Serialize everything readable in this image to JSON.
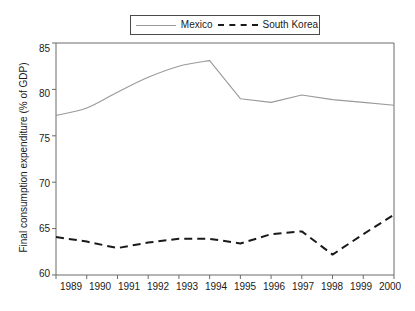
{
  "chart_data": {
    "type": "line",
    "title": "",
    "xlabel": "",
    "ylabel": "Final consumption expenditure (% of GDP)",
    "x": [
      1989,
      1990,
      1991,
      1992,
      1993,
      1994,
      1995,
      1996,
      1997,
      1998,
      1999,
      2000
    ],
    "categories": [
      "1989",
      "1990",
      "1991",
      "1992",
      "1993",
      "1994",
      "1995",
      "1996",
      "1997",
      "1998",
      "1999",
      "2000"
    ],
    "xlim": [
      1989,
      2000
    ],
    "ylim": [
      60,
      85
    ],
    "yticks": [
      60,
      65,
      70,
      75,
      80,
      85
    ],
    "ytick_labels": [
      "60",
      "65",
      "70",
      "75",
      "80",
      "85"
    ],
    "grid": false,
    "legend_position": "top-center",
    "series": [
      {
        "name": "Mexico",
        "style": "solid",
        "color": "#9a9a9a",
        "values": [
          77.2,
          78.0,
          79.7,
          81.3,
          82.5,
          83.1,
          79.0,
          78.6,
          79.4,
          78.9,
          78.6,
          78.3
        ]
      },
      {
        "name": "South Korea",
        "style": "dashed",
        "color": "#1a1a1a",
        "values": [
          64.1,
          63.6,
          62.9,
          63.5,
          63.9,
          63.9,
          63.4,
          64.4,
          64.7,
          62.2,
          64.4,
          66.5
        ]
      }
    ]
  },
  "legend": {
    "entries": [
      {
        "label": "Mexico",
        "swatch": "solid-line-gray"
      },
      {
        "label": "South Korea",
        "swatch": "dashed-line-black"
      }
    ]
  },
  "axes": {
    "y_title": "Final consumption expenditure (% of GDP)",
    "y_tick_labels": [
      "85",
      "80",
      "75",
      "70",
      "65",
      "60"
    ],
    "x_tick_labels": [
      "1989",
      "1990",
      "1991",
      "1992",
      "1993",
      "1994",
      "1995",
      "1996",
      "1997",
      "1998",
      "1999",
      "2000"
    ]
  },
  "colors": {
    "mexico_line": "#9a9a9a",
    "south_korea_line": "#1a1a1a",
    "axis": "#6b6b6b",
    "text": "#1a1a1a",
    "background": "#ffffff"
  }
}
